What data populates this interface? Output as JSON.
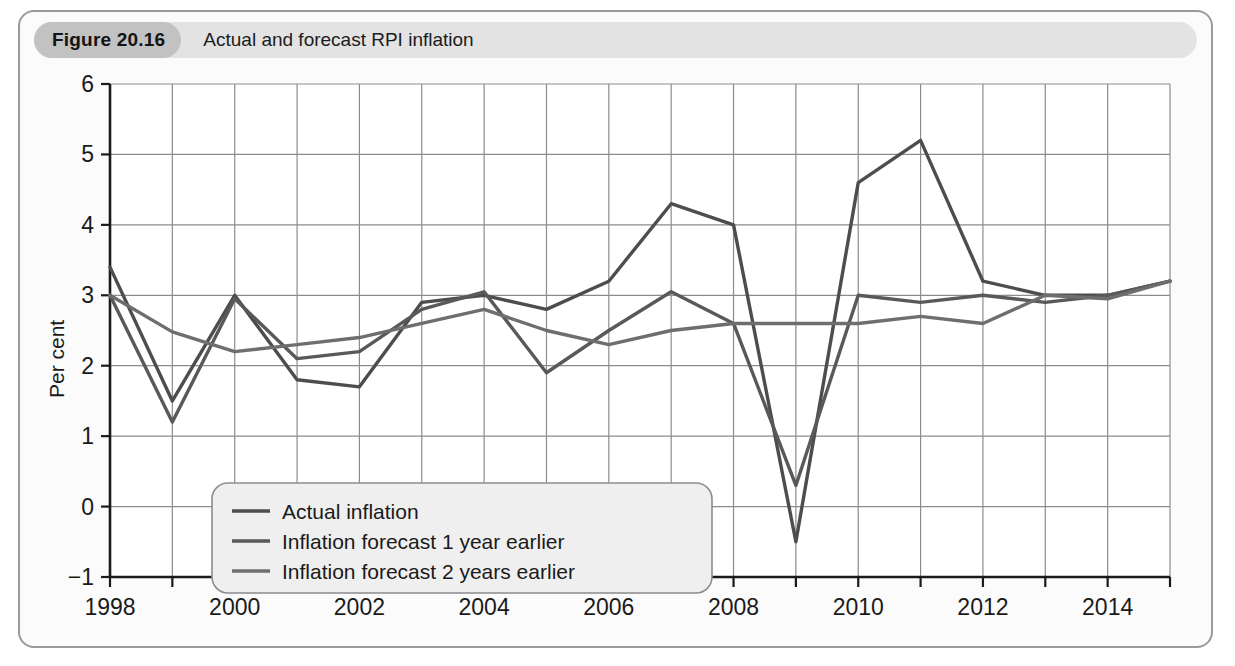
{
  "figure": {
    "number_label": "Figure 20.16",
    "caption": "Actual and forecast RPI inflation"
  },
  "colors": {
    "card_border": "#9a9a9a",
    "header_bg": "#e3e3e3",
    "number_pill_bg": "#c2c2c2",
    "plot_bg": "#ffffff",
    "grid": "#8c8c8c",
    "axis": "#1a1a1a",
    "series_actual": "#4d4d4d",
    "series_forecast_1y": "#595959",
    "series_forecast_2y": "#6e6e6e",
    "legend_bg": "#efefef",
    "legend_border": "#8c8c8c"
  },
  "chart_data": {
    "type": "line",
    "title": "Actual and forecast RPI inflation",
    "xlabel": "",
    "ylabel": "Per cent",
    "xlim": [
      1998,
      2015
    ],
    "ylim": [
      -1,
      6
    ],
    "yticks": [
      -1,
      0,
      1,
      2,
      3,
      4,
      5,
      6
    ],
    "xticks": [
      1998,
      1999,
      2000,
      2001,
      2002,
      2003,
      2004,
      2005,
      2006,
      2007,
      2008,
      2009,
      2010,
      2011,
      2012,
      2013,
      2014,
      2015
    ],
    "xtick_labels_shown": [
      "1998",
      "",
      "2000",
      "",
      "2002",
      "",
      "2004",
      "",
      "2006",
      "",
      "2008",
      "",
      "2010",
      "",
      "2012",
      "",
      "2014",
      ""
    ],
    "grid": true,
    "legend_position": "lower left",
    "x": [
      1998,
      1999,
      2000,
      2001,
      2002,
      2003,
      2004,
      2005,
      2006,
      2007,
      2008,
      2009,
      2010,
      2011,
      2012,
      2013,
      2014,
      2015
    ],
    "series": [
      {
        "name": "Actual inflation",
        "values": [
          3.4,
          1.5,
          3.0,
          1.8,
          1.7,
          2.9,
          3.0,
          2.8,
          3.2,
          4.3,
          4.0,
          -0.5,
          4.6,
          5.2,
          3.2,
          3.0,
          3.0,
          3.2
        ]
      },
      {
        "name": "Inflation forecast 1 year earlier",
        "values": [
          3.0,
          1.2,
          2.95,
          2.1,
          2.2,
          2.8,
          3.05,
          1.9,
          2.5,
          3.05,
          2.6,
          0.3,
          3.0,
          2.9,
          3.0,
          2.9,
          3.0,
          3.2
        ]
      },
      {
        "name": "Inflation forecast 2 years earlier",
        "values": [
          3.0,
          2.48,
          2.2,
          2.3,
          2.4,
          2.6,
          2.8,
          2.5,
          2.3,
          2.5,
          2.6,
          2.6,
          2.6,
          2.7,
          2.6,
          3.0,
          2.95,
          3.2
        ]
      }
    ]
  },
  "legend": {
    "items": [
      {
        "label": "Actual inflation"
      },
      {
        "label": "Inflation forecast 1 year earlier"
      },
      {
        "label": "Inflation forecast 2 years earlier"
      }
    ]
  },
  "axis": {
    "y_title": "Per cent"
  }
}
